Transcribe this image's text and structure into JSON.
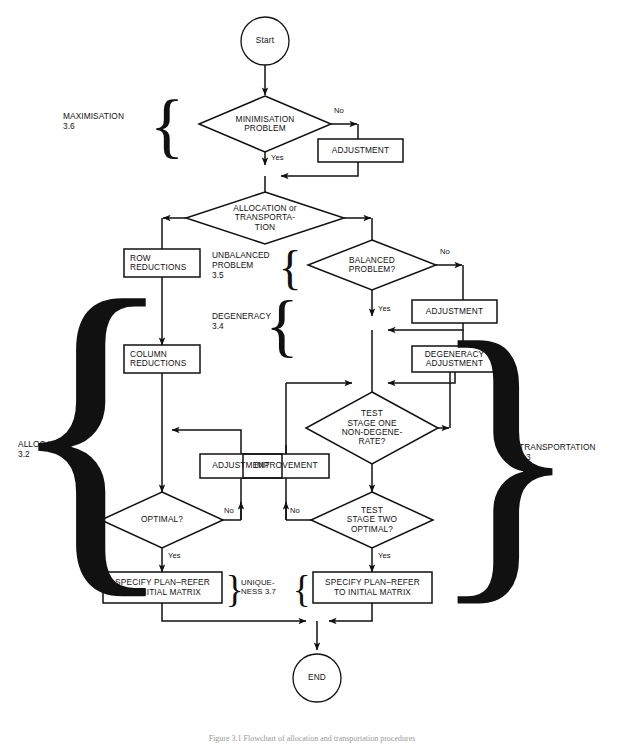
{
  "figure": {
    "caption": "Figure 3.1  Flowchart of allocation and transportation procedures",
    "background": "#ffffff",
    "ink": "#111111"
  },
  "nodes": {
    "start": {
      "label": "Start",
      "shape": "circle"
    },
    "minimisation": {
      "label": "MINIMISATION\nPROBLEM",
      "shape": "diamond"
    },
    "adjustment_top": {
      "label": "ADJUSTMENT",
      "shape": "rect"
    },
    "alloc_or_transp": {
      "label": "ALLOCATION or\nTRANSPORTA-\nTION",
      "shape": "diamond"
    },
    "row_reductions": {
      "label": "ROW\nREDUCTIONS",
      "shape": "rect"
    },
    "balanced": {
      "label": "BALANCED\nPROBLEM?",
      "shape": "diamond"
    },
    "adjustment_right": {
      "label": "ADJUSTMENT",
      "shape": "rect"
    },
    "degeneracy_adjustment": {
      "label": "DEGENERACY\nADJUSTMENT",
      "shape": "rect"
    },
    "column_reductions": {
      "label": "COLUMN\nREDUCTIONS",
      "shape": "rect"
    },
    "test_stage_one": {
      "label": "TEST\nSTAGE ONE\nNON-DEGENE-\nRATE?",
      "shape": "diamond"
    },
    "adjustment_left": {
      "label": "ADJUSTMENT",
      "shape": "rect"
    },
    "improvement": {
      "label": "IMPROVEMENT",
      "shape": "rect"
    },
    "optimal": {
      "label": "OPTIMAL?",
      "shape": "diamond"
    },
    "test_stage_two": {
      "label": "TEST\nSTAGE TWO\nOPTIMAL?",
      "shape": "diamond"
    },
    "specify_plan_left": {
      "label": "SPECIFY PLAN–REFER\nTO INITIAL MATRIX",
      "shape": "rect"
    },
    "specify_plan_right": {
      "label": "SPECIFY PLAN–REFER\nTO INITIAL MATRIX",
      "shape": "rect"
    },
    "end": {
      "label": "END",
      "shape": "circle"
    }
  },
  "edge_labels": {
    "min_no": "No",
    "min_yes": "Yes",
    "balanced_no": "No",
    "balanced_yes": "Yes",
    "optimal_no": "No",
    "optimal_yes": "Yes",
    "stage_two_no": "No",
    "stage_two_yes": "Yes"
  },
  "section_labels": {
    "maximisation": "MAXIMISATION\n3.6",
    "unbalanced": "UNBALANCED\nPROBLEM\n3.5",
    "degeneracy": "DEGENERACY\n3.4",
    "allocation": "ALLOCATION\n3.2",
    "transportation": "TRANSPORTATION\n3.3",
    "uniqueness": "UNIQUE-\nNESS 3.7"
  },
  "braces": {
    "maximisation": "{",
    "unbalanced": "{",
    "degeneracy": "{",
    "allocation": "{",
    "transportation": "}",
    "uniqueness_left": "}",
    "uniqueness_right": "{"
  }
}
